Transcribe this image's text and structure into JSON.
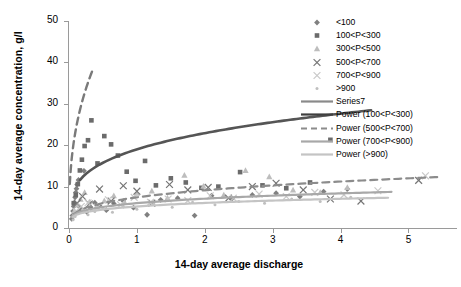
{
  "chart_data": {
    "type": "scatter",
    "title": "",
    "xlabel": "14-day average discharge",
    "ylabel": "14-day average concentration, g/l",
    "xlim": [
      0,
      5.7
    ],
    "ylim": [
      0,
      50
    ],
    "xticks": [
      "0",
      "1",
      "2",
      "3",
      "4",
      "5"
    ],
    "yticks": [
      "0",
      "10",
      "20",
      "30",
      "40",
      "50"
    ],
    "grid": false,
    "legend_position": "top-right",
    "series": [
      {
        "name": "<100",
        "marker": "diamond",
        "color": "#808080",
        "points": [
          [
            0.04,
            2.2
          ],
          [
            0.05,
            3.0
          ],
          [
            0.06,
            4.1
          ],
          [
            0.07,
            5.2
          ],
          [
            0.08,
            6.0
          ],
          [
            0.09,
            7.4
          ],
          [
            0.1,
            8.6
          ],
          [
            0.11,
            9.5
          ],
          [
            0.12,
            10.5
          ],
          [
            0.14,
            11.6
          ],
          [
            0.16,
            5.0
          ],
          [
            0.18,
            4.4
          ],
          [
            0.22,
            13.8
          ],
          [
            0.26,
            3.9
          ],
          [
            0.32,
            4.8
          ],
          [
            0.38,
            6.1
          ],
          [
            0.45,
            5.4
          ],
          [
            0.55,
            4.3
          ],
          [
            0.66,
            5.9
          ],
          [
            0.8,
            6.5
          ],
          [
            0.95,
            4.9
          ],
          [
            1.15,
            3.2
          ],
          [
            1.35,
            6.8
          ],
          [
            1.6,
            7.2
          ],
          [
            1.85,
            3.0
          ],
          [
            2.1,
            7.8
          ],
          [
            2.4,
            7.1
          ],
          [
            2.7,
            8.0
          ],
          [
            3.05,
            8.4
          ],
          [
            3.4,
            7.6
          ],
          [
            3.75,
            8.8
          ],
          [
            4.1,
            9.4
          ]
        ]
      },
      {
        "name": "100<P<300",
        "marker": "square",
        "color": "#6b6b6b",
        "points": [
          [
            0.07,
            6.0
          ],
          [
            0.1,
            8.0
          ],
          [
            0.13,
            10.6
          ],
          [
            0.16,
            13.9
          ],
          [
            0.19,
            16.5
          ],
          [
            0.23,
            19.8
          ],
          [
            0.28,
            21.2
          ],
          [
            0.33,
            26.0
          ],
          [
            0.42,
            15.6
          ],
          [
            0.52,
            22.2
          ],
          [
            0.62,
            20.2
          ],
          [
            0.72,
            17.5
          ],
          [
            0.85,
            13.6
          ],
          [
            0.98,
            11.4
          ],
          [
            1.12,
            16.2
          ],
          [
            1.28,
            10.3
          ],
          [
            1.5,
            12.0
          ],
          [
            1.72,
            11.0
          ],
          [
            1.95,
            9.7
          ],
          [
            2.2,
            10.0
          ],
          [
            2.52,
            13.5
          ],
          [
            2.85,
            10.3
          ],
          [
            3.2,
            9.6
          ],
          [
            3.55,
            11.0
          ],
          [
            3.85,
            21.3
          ]
        ]
      },
      {
        "name": "300<P<500",
        "marker": "triangle",
        "color": "#bdbdbd",
        "points": [
          [
            0.08,
            4.2
          ],
          [
            0.12,
            5.6
          ],
          [
            0.17,
            7.0
          ],
          [
            0.23,
            8.6
          ],
          [
            0.3,
            6.3
          ],
          [
            0.4,
            5.1
          ],
          [
            0.52,
            6.6
          ],
          [
            0.66,
            7.8
          ],
          [
            0.82,
            6.2
          ],
          [
            1.0,
            8.4
          ],
          [
            1.22,
            9.0
          ],
          [
            1.45,
            7.3
          ],
          [
            1.7,
            12.8
          ],
          [
            1.98,
            10.1
          ],
          [
            2.28,
            8.0
          ],
          [
            2.6,
            13.9
          ],
          [
            2.95,
            12.4
          ],
          [
            3.3,
            9.2
          ],
          [
            3.7,
            8.6
          ],
          [
            4.1,
            9.8
          ]
        ]
      },
      {
        "name": "500<P<700",
        "marker": "cross-x",
        "color": "#757575",
        "points": [
          [
            0.12,
            6.0
          ],
          [
            0.2,
            7.6
          ],
          [
            0.3,
            5.8
          ],
          [
            0.45,
            9.4
          ],
          [
            0.62,
            6.5
          ],
          [
            0.8,
            10.2
          ],
          [
            1.0,
            8.9
          ],
          [
            1.22,
            6.0
          ],
          [
            1.48,
            10.5
          ],
          [
            1.75,
            9.2
          ],
          [
            2.05,
            9.8
          ],
          [
            2.35,
            7.2
          ],
          [
            2.7,
            10.0
          ],
          [
            3.05,
            10.8
          ],
          [
            3.45,
            9.2
          ],
          [
            3.85,
            7.0
          ],
          [
            4.3,
            6.5
          ],
          [
            5.15,
            11.5
          ]
        ]
      },
      {
        "name": "700<P<900",
        "marker": "cross-x",
        "color": "#c9c9c9",
        "points": [
          [
            0.1,
            4.0
          ],
          [
            0.18,
            5.2
          ],
          [
            0.28,
            6.1
          ],
          [
            0.42,
            5.0
          ],
          [
            0.58,
            6.8
          ],
          [
            0.76,
            5.6
          ],
          [
            0.96,
            7.4
          ],
          [
            1.2,
            6.2
          ],
          [
            1.46,
            7.0
          ],
          [
            1.75,
            6.6
          ],
          [
            2.08,
            7.8
          ],
          [
            2.42,
            7.2
          ],
          [
            2.8,
            8.2
          ],
          [
            3.2,
            7.6
          ],
          [
            3.62,
            8.6
          ],
          [
            4.05,
            8.0
          ],
          [
            4.55,
            9.0
          ],
          [
            5.25,
            12.6
          ]
        ]
      },
      {
        "name": ">900",
        "marker": "dot",
        "color": "#bfbfbf",
        "points": [
          [
            0.06,
            2.0
          ],
          [
            0.09,
            2.8
          ],
          [
            0.14,
            3.6
          ],
          [
            0.2,
            4.4
          ],
          [
            0.28,
            3.2
          ],
          [
            0.38,
            4.0
          ],
          [
            0.5,
            4.8
          ],
          [
            0.64,
            3.8
          ],
          [
            0.8,
            5.2
          ],
          [
            1.0,
            4.5
          ],
          [
            1.25,
            5.8
          ],
          [
            1.52,
            5.0
          ],
          [
            1.82,
            6.2
          ],
          [
            2.15,
            5.6
          ],
          [
            2.5,
            6.4
          ],
          [
            2.88,
            6.0
          ],
          [
            3.28,
            7.0
          ],
          [
            3.7,
            6.4
          ],
          [
            4.15,
            7.4
          ]
        ]
      }
    ],
    "trendlines": [
      {
        "name": "Series7",
        "style": "dashed",
        "color": "#7a7a7a",
        "width": 2.4,
        "type": "power",
        "coefficient": 57.0,
        "exponent": 0.38,
        "xrange": [
          0.012,
          0.36
        ]
      },
      {
        "name": "Power (100<P<300)",
        "style": "solid",
        "color": "#555555",
        "width": 2.6,
        "type": "power",
        "coefficient": 19.0,
        "exponent": 0.27,
        "xrange": [
          0.16,
          4.45
        ]
      },
      {
        "name": "Power (500<P<700)",
        "style": "dashed",
        "color": "#8c8c8c",
        "width": 2.2,
        "type": "power",
        "coefficient": 7.4,
        "exponent": 0.3,
        "xrange": [
          0.07,
          5.45
        ]
      },
      {
        "name": "Power (700<P<900)",
        "style": "solid",
        "color": "#a8a8a8",
        "width": 2.2,
        "type": "power",
        "coefficient": 6.0,
        "exponent": 0.24,
        "xrange": [
          0.05,
          4.75
        ]
      },
      {
        "name": "Power (>900)",
        "style": "solid",
        "color": "#c4c4c4",
        "width": 2.2,
        "type": "power",
        "coefficient": 5.2,
        "exponent": 0.22,
        "xrange": [
          0.05,
          4.7
        ]
      }
    ],
    "legend_entries": [
      {
        "label": "<100",
        "kind": "marker",
        "marker": "diamond",
        "color": "#808080"
      },
      {
        "label": "100<P<300",
        "kind": "marker",
        "marker": "square",
        "color": "#6b6b6b"
      },
      {
        "label": "300<P<500",
        "kind": "marker",
        "marker": "triangle",
        "color": "#bdbdbd"
      },
      {
        "label": "500<P<700",
        "kind": "marker",
        "marker": "cross-x",
        "color": "#757575"
      },
      {
        "label": "700<P<900",
        "kind": "marker",
        "marker": "cross-x",
        "color": "#c9c9c9"
      },
      {
        "label": ">900",
        "kind": "marker",
        "marker": "dot",
        "color": "#bfbfbf"
      },
      {
        "label": "Series7",
        "kind": "line",
        "style": "solid",
        "color": "#8a8a8a"
      },
      {
        "label": "Power (100<P<300)",
        "kind": "line",
        "style": "solid",
        "color": "#3f3f3f"
      },
      {
        "label": "Power (500<P<700)",
        "kind": "line",
        "style": "dashed",
        "color": "#8c8c8c"
      },
      {
        "label": "Power (700<P<900)",
        "kind": "line",
        "style": "solid",
        "color": "#a8a8a8"
      },
      {
        "label": "Power (>900)",
        "kind": "line",
        "style": "solid",
        "color": "#c4c4c4"
      }
    ]
  }
}
